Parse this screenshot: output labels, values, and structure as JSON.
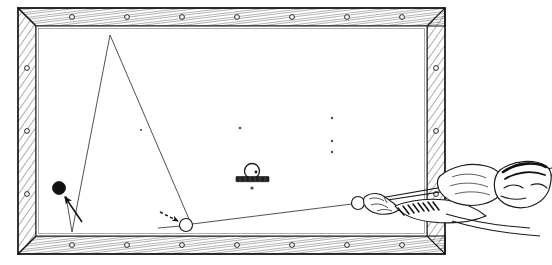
{
  "illustration": {
    "title": "Billiard table bank shot diagram",
    "subject": "pool-table-top-view-with-player",
    "style": "vintage engraved line drawing",
    "colors": {
      "ink": "#1a1a1a",
      "paper": "#ffffff",
      "cloth": "#ffffff",
      "rail_hatch": "#333333",
      "ball_solid": "#111111",
      "ball_outline": "#222222"
    }
  },
  "table": {
    "label": "billiard-table",
    "outer_rect": {
      "x": 18,
      "y": 8,
      "w": 427,
      "h": 246
    },
    "rail_width": 18,
    "bed_rect": {
      "x": 36,
      "y": 26,
      "w": 391,
      "h": 210
    },
    "sight_markers": {
      "label": "rail-sight-dots",
      "top_y": 17,
      "bottom_y": 245,
      "left_x": 27,
      "right_x": 436,
      "top_x": [
        72,
        127,
        182,
        237,
        292,
        347,
        402
      ],
      "bottom_x": [
        72,
        127,
        182,
        237,
        292,
        347,
        402
      ],
      "left_y": [
        68,
        131,
        194
      ],
      "right_y": [
        68,
        131,
        194
      ]
    }
  },
  "balls": [
    {
      "name": "object-ball-target-black",
      "kind": "solid",
      "cx": 59,
      "cy": 188,
      "r": 6.5,
      "fill": "#111111"
    },
    {
      "name": "object-ball-white",
      "kind": "outline",
      "cx": 186,
      "cy": 225,
      "r": 6.5,
      "fill": "#ffffff"
    },
    {
      "name": "cue-ball",
      "kind": "outline",
      "cx": 358,
      "cy": 203,
      "r": 6.5,
      "fill": "#ffffff"
    },
    {
      "name": "ball-on-stand",
      "kind": "outline-with-dot",
      "cx": 252,
      "cy": 171,
      "r": 7.5,
      "fill": "#ffffff"
    }
  ],
  "stand": {
    "name": "ball-rest-block",
    "x": 236,
    "y": 177,
    "w": 33,
    "h": 5
  },
  "spots": {
    "name": "table-spot-dots",
    "points": [
      {
        "x": 141,
        "y": 130
      },
      {
        "x": 240,
        "y": 128
      },
      {
        "x": 332,
        "y": 118
      },
      {
        "x": 332,
        "y": 141
      },
      {
        "x": 332,
        "y": 152
      },
      {
        "x": 252,
        "y": 188
      }
    ]
  },
  "trajectory": {
    "name": "shot-path",
    "description": "cue ball strikes object ball, banks off top rail, off bottom rail, into black ball",
    "segments": [
      {
        "from": "cue-ball",
        "to": "object-ball-white",
        "x1": 352,
        "y1": 204,
        "x2": 192,
        "y2": 224
      },
      {
        "from": "object-ball-white",
        "to": "bottom-rail-kiss",
        "x1": 186,
        "y1": 225,
        "x2": 160,
        "y2": 227
      },
      {
        "from": "object-ball-white",
        "to": "top-rail",
        "x1": 190,
        "y1": 220,
        "x2": 110,
        "y2": 35
      },
      {
        "from": "top-rail",
        "to": "bottom-rail",
        "x1": 110,
        "y1": 35,
        "x2": 72,
        "y2": 232
      },
      {
        "from": "bottom-rail",
        "to": "object-ball-target-black",
        "x1": 72,
        "y1": 232,
        "x2": 65,
        "y2": 195
      }
    ]
  },
  "arrows": [
    {
      "name": "arrow-to-black-ball",
      "style": "solid",
      "x1": 82,
      "y1": 222,
      "x2": 64,
      "y2": 196
    },
    {
      "name": "arrow-to-white-ball",
      "style": "dashed",
      "x1": 161,
      "y1": 213,
      "x2": 179,
      "y2": 222
    }
  ],
  "cue": {
    "name": "cue-stick",
    "tip": {
      "x": 365,
      "y": 200
    },
    "butt": {
      "x": 470,
      "y": 183
    }
  },
  "player": {
    "name": "player-figure",
    "description": "player leaning over right end rail, bridge hand on table, head at far right",
    "bridge_hand": {
      "x": 372,
      "y": 196
    },
    "head": {
      "x": 505,
      "y": 183
    }
  }
}
